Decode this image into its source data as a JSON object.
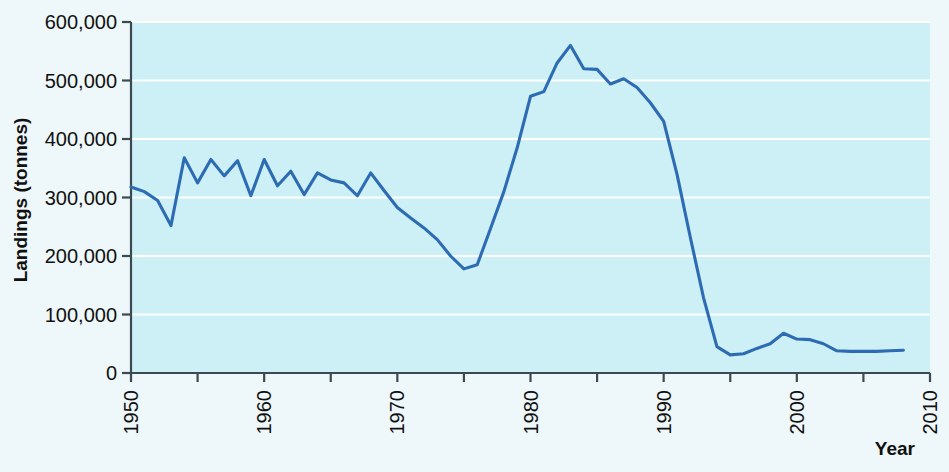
{
  "chart_data": {
    "type": "line",
    "title": "",
    "xlabel": "Year",
    "ylabel": "Landings (tonnes)",
    "xlim": [
      1950,
      2010
    ],
    "ylim": [
      0,
      600000
    ],
    "grid": true,
    "legend": "none",
    "line_color": "#2d6cb3",
    "plot_background_color": "#cdeff6",
    "page_background_color": "#eef7f9",
    "gridline_color": "#ffffff",
    "axis_color": "#3b4a52",
    "xticks": [
      1950,
      1960,
      1970,
      1980,
      1990,
      2000,
      2010
    ],
    "xtick_labels": [
      "1950",
      "1960",
      "1970",
      "1980",
      "1990",
      "2000",
      "2010"
    ],
    "xminor_ticks": [
      1955,
      1965,
      1975,
      1985,
      1995,
      2005
    ],
    "yticks": [
      0,
      100000,
      200000,
      300000,
      400000,
      500000,
      600000
    ],
    "ytick_labels": [
      "0",
      "100,000",
      "200,000",
      "300,000",
      "400,000",
      "500,000",
      "600,000"
    ],
    "x": [
      1950,
      1951,
      1952,
      1953,
      1954,
      1955,
      1956,
      1957,
      1958,
      1959,
      1960,
      1961,
      1962,
      1963,
      1964,
      1965,
      1966,
      1967,
      1968,
      1969,
      1970,
      1971,
      1972,
      1973,
      1974,
      1975,
      1976,
      1977,
      1978,
      1979,
      1980,
      1981,
      1982,
      1983,
      1984,
      1985,
      1986,
      1987,
      1988,
      1989,
      1990,
      1991,
      1992,
      1993,
      1994,
      1995,
      1996,
      1997,
      1998,
      1999,
      2000,
      2001,
      2002,
      2003,
      2004,
      2005,
      2006,
      2007,
      2008
    ],
    "values": [
      318000,
      310000,
      295000,
      252000,
      368000,
      325000,
      365000,
      337000,
      363000,
      303000,
      365000,
      320000,
      345000,
      305000,
      342000,
      330000,
      325000,
      303000,
      342000,
      312000,
      283000,
      265000,
      248000,
      228000,
      200000,
      178000,
      185000,
      247000,
      310000,
      385000,
      473000,
      481000,
      530000,
      560000,
      520000,
      519000,
      494000,
      503000,
      488000,
      462000,
      430000,
      340000,
      232000,
      128000,
      45000,
      31000,
      33000,
      42000,
      50000,
      68000,
      58000,
      57000,
      50000,
      38000,
      37000,
      37000,
      37000,
      38000,
      39000
    ],
    "units": "tonnes",
    "series_name": "Landings"
  },
  "axes": {
    "y_title": "Landings (tonnes)",
    "x_title": "Year"
  }
}
